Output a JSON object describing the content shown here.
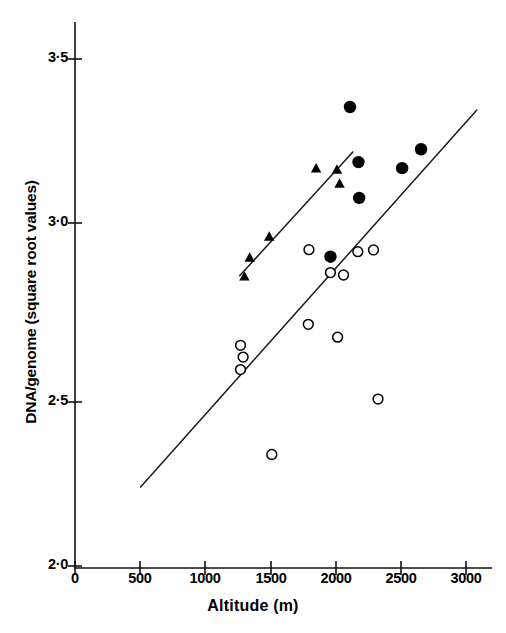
{
  "chart_data": {
    "type": "scatter",
    "title": "",
    "xlabel": "Altitude (m)",
    "ylabel": "DNA/genome (square root values)",
    "xlim": [
      0,
      3050
    ],
    "ylim": [
      2.0,
      3.55
    ],
    "xticks": [
      0,
      500,
      1000,
      1500,
      2000,
      2500,
      3000
    ],
    "xticklabels": [
      "0",
      "500",
      "1000",
      "1500",
      "2000",
      "2500",
      "3000"
    ],
    "yticks": [
      2.0,
      2.5,
      3.0,
      3.5
    ],
    "yticklabels": [
      "2·2",
      "2·5",
      "3·0",
      "3·5"
    ],
    "ytick_display": [
      "2·0",
      "2·5",
      "3·0",
      "3·5"
    ],
    "grid": false,
    "legend_position": "none",
    "series": [
      {
        "name": "filled-circles",
        "marker": "filled-circle",
        "color": "#000000",
        "points": [
          {
            "x": 1960,
            "y": 2.915
          },
          {
            "x": 2110,
            "y": 3.358
          },
          {
            "x": 2175,
            "y": 3.195
          },
          {
            "x": 2180,
            "y": 3.089
          },
          {
            "x": 2510,
            "y": 3.177
          },
          {
            "x": 2655,
            "y": 3.233
          }
        ]
      },
      {
        "name": "filled-triangles",
        "marker": "filled-triangle",
        "color": "#000000",
        "points": [
          {
            "x": 1300,
            "y": 2.855
          },
          {
            "x": 1340,
            "y": 2.911
          },
          {
            "x": 1490,
            "y": 2.973
          },
          {
            "x": 1850,
            "y": 3.175
          },
          {
            "x": 2010,
            "y": 3.171
          },
          {
            "x": 2030,
            "y": 3.13
          }
        ]
      },
      {
        "name": "open-circles",
        "marker": "open-circle",
        "color": "#000000",
        "points": [
          {
            "x": 1270,
            "y": 2.653
          },
          {
            "x": 1290,
            "y": 2.618
          },
          {
            "x": 1270,
            "y": 2.581
          },
          {
            "x": 1510,
            "y": 2.33
          },
          {
            "x": 1790,
            "y": 2.715
          },
          {
            "x": 1795,
            "y": 2.936
          },
          {
            "x": 1960,
            "y": 2.868
          },
          {
            "x": 2015,
            "y": 2.677
          },
          {
            "x": 2060,
            "y": 2.861
          },
          {
            "x": 2170,
            "y": 2.93
          },
          {
            "x": 2290,
            "y": 2.935
          },
          {
            "x": 2325,
            "y": 2.494
          }
        ]
      }
    ],
    "trend_lines": [
      {
        "name": "upper-regression-line",
        "x0": 1260,
        "y0": 2.857,
        "x1": 2135,
        "y1": 3.226
      },
      {
        "name": "lower-regression-line",
        "x0": 500,
        "y0": 2.232,
        "x1": 3085,
        "y1": 3.35
      }
    ]
  },
  "axis": {
    "x_title": "Altitude (m)",
    "y_title": "DNA/genome (square root values)"
  }
}
